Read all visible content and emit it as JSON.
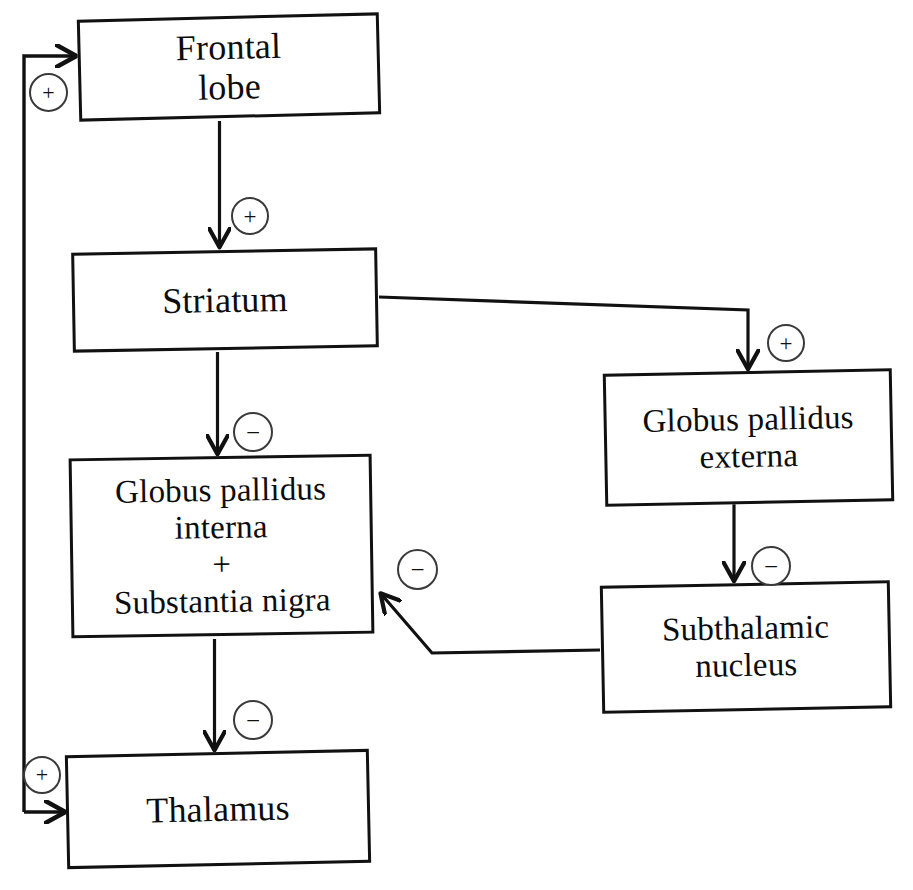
{
  "diagram": {
    "background_color": "#ffffff",
    "line_color": "#111111",
    "text_color": "#0d0d0d",
    "width": 913,
    "height": 890,
    "nodes": [
      {
        "id": "frontal-lobe",
        "label": "Frontal\nlobe",
        "x": 78,
        "y": 16,
        "w": 302,
        "h": 102,
        "rotate": -1.4,
        "font_size": 36
      },
      {
        "id": "striatum",
        "label": "Striatum",
        "x": 72,
        "y": 250,
        "w": 306,
        "h": 100,
        "rotate": -1.0,
        "font_size": 36
      },
      {
        "id": "globus-pallidus-interna",
        "label": "Globus pallidus\ninterna\n+\nSubstantia nigra",
        "x": 70,
        "y": 456,
        "w": 303,
        "h": 180,
        "rotate": -0.9,
        "font_size": 33
      },
      {
        "id": "thalamus",
        "label": "Thalamus",
        "x": 66,
        "y": 752,
        "w": 304,
        "h": 114,
        "rotate": -1.2,
        "font_size": 36
      },
      {
        "id": "globus-pallidus-externa",
        "label": "Globus pallidus\nexterna",
        "x": 604,
        "y": 371,
        "w": 289,
        "h": 133,
        "rotate": -1.1,
        "font_size": 33
      },
      {
        "id": "subthalamic-nucleus",
        "label": "Subthalamic\nnucleus",
        "x": 601,
        "y": 583,
        "w": 290,
        "h": 128,
        "rotate": -1.1,
        "font_size": 33
      }
    ],
    "edges": [
      {
        "id": "frontal-lobe-to-striatum",
        "from": "frontal-lobe",
        "to": "striatum",
        "sign": "+"
      },
      {
        "id": "striatum-to-globus-pallidus-interna",
        "from": "striatum",
        "to": "globus-pallidus-interna",
        "sign": "−"
      },
      {
        "id": "globus-pallidus-interna-to-thalamus",
        "from": "globus-pallidus-interna",
        "to": "thalamus",
        "sign": "−"
      },
      {
        "id": "striatum-to-globus-pallidus-externa",
        "from": "striatum",
        "to": "globus-pallidus-externa",
        "sign": "+"
      },
      {
        "id": "globus-pallidus-externa-to-subthalamic-nucleus",
        "from": "globus-pallidus-externa",
        "to": "subthalamic-nucleus",
        "sign": "−"
      },
      {
        "id": "subthalamic-nucleus-to-globus-pallidus-interna",
        "from": "subthalamic-nucleus",
        "to": "globus-pallidus-interna",
        "sign": "−"
      },
      {
        "id": "thalamus-to-frontal-lobe",
        "from": "thalamus",
        "to": "frontal-lobe",
        "sign": "+"
      },
      {
        "id": "feedback-to-thalamus",
        "from": "thalamus",
        "to": "thalamus",
        "sign": "+"
      }
    ],
    "signs": [
      {
        "id": "sign-frontal-to-striatum",
        "symbol": "+",
        "x": 231,
        "y": 197,
        "d": 38,
        "font_size": 23
      },
      {
        "id": "sign-striatum-to-gpi",
        "symbol": "−",
        "x": 233,
        "y": 412,
        "d": 40,
        "font_size": 25
      },
      {
        "id": "sign-gpi-to-thalamus",
        "symbol": "−",
        "x": 233,
        "y": 700,
        "d": 40,
        "font_size": 25
      },
      {
        "id": "sign-striatum-to-gpe",
        "symbol": "+",
        "x": 767,
        "y": 324,
        "d": 38,
        "font_size": 23
      },
      {
        "id": "sign-gpe-to-stn",
        "symbol": "−",
        "x": 751,
        "y": 546,
        "d": 40,
        "font_size": 25
      },
      {
        "id": "sign-stn-to-gpi",
        "symbol": "−",
        "x": 397,
        "y": 549,
        "d": 41,
        "font_size": 25
      },
      {
        "id": "sign-thalamus-to-frontal",
        "symbol": "+",
        "x": 29,
        "y": 73,
        "d": 39,
        "font_size": 22
      },
      {
        "id": "sign-feedback-thalamus",
        "symbol": "+",
        "x": 23,
        "y": 756,
        "d": 38,
        "font_size": 22
      }
    ]
  }
}
